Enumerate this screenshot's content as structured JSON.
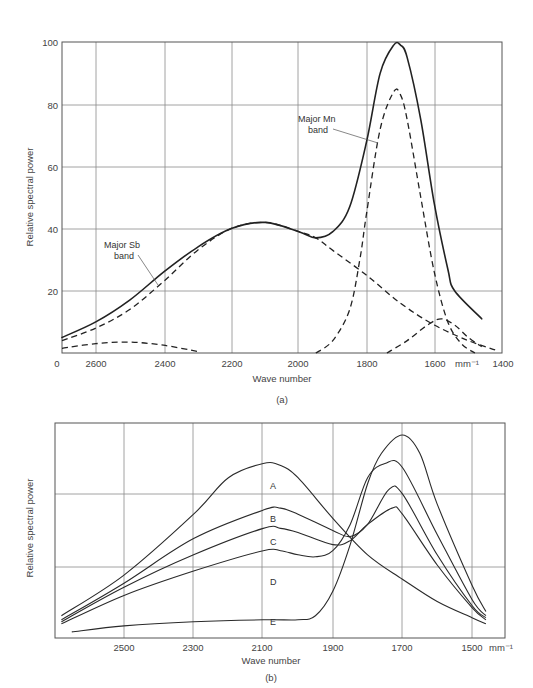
{
  "chart_data": [
    {
      "id": "a",
      "type": "line",
      "caption": "(a)",
      "title": "",
      "xlabel": "Wave number",
      "ylabel": "Relative spectral power",
      "x_unit": "mm⁻¹",
      "xlim": [
        2700,
        1400
      ],
      "ylim": [
        0,
        100
      ],
      "x_ticks": [
        "2600",
        "2400",
        "2200",
        "2000",
        "1800",
        "1600",
        "1400"
      ],
      "y_ticks": [
        "0",
        "20",
        "40",
        "60",
        "80",
        "100"
      ],
      "grid": true,
      "annotations": [
        {
          "text": "Major  Sb",
          "text2": "band"
        },
        {
          "text": "Major  Mn",
          "text2": "band"
        }
      ],
      "series": [
        {
          "name": "Total spectrum",
          "style": "solid",
          "x": [
            2700,
            2600,
            2500,
            2400,
            2300,
            2200,
            2100,
            2000,
            1950,
            1900,
            1850,
            1800,
            1760,
            1720,
            1700,
            1680,
            1640,
            1600,
            1560,
            1540,
            1460
          ],
          "y": [
            5,
            10,
            17,
            26,
            34,
            40,
            42,
            39,
            37,
            39,
            47,
            68,
            90,
            99,
            99,
            95,
            75,
            48,
            27,
            20,
            11
          ]
        },
        {
          "name": "Major Sb band",
          "style": "dashed",
          "x": [
            2700,
            2600,
            2500,
            2400,
            2300,
            2200,
            2100,
            2000,
            1950,
            1900,
            1800,
            1700,
            1600,
            1500,
            1420
          ],
          "y": [
            4,
            8,
            14,
            23,
            33,
            40,
            42,
            39,
            37,
            33,
            25,
            16,
            9,
            4,
            1
          ]
        },
        {
          "name": "Major Mn band",
          "style": "dashed",
          "x": [
            1950,
            1900,
            1850,
            1820,
            1800,
            1760,
            1720,
            1700,
            1680,
            1640,
            1600,
            1560,
            1520,
            1480
          ],
          "y": [
            0,
            4,
            14,
            30,
            45,
            72,
            84,
            83,
            75,
            50,
            26,
            10,
            3,
            0
          ]
        },
        {
          "name": "Minor band (low)",
          "style": "dashed",
          "x": [
            2700,
            2600,
            2500,
            2400,
            2300
          ],
          "y": [
            1.5,
            3,
            3.5,
            2.5,
            0.5
          ]
        },
        {
          "name": "Minor band (1580)",
          "style": "dashed",
          "x": [
            1740,
            1680,
            1620,
            1580,
            1540,
            1500,
            1460
          ],
          "y": [
            0,
            4,
            9,
            11,
            9,
            5,
            2
          ]
        }
      ]
    },
    {
      "id": "b",
      "type": "line",
      "caption": "(b)",
      "title": "",
      "xlabel": "Wave number",
      "ylabel": "Relative spectral power",
      "x_unit": "mm⁻¹",
      "xlim": [
        2700,
        1420
      ],
      "x_ticks": [
        "2500",
        "2300",
        "2100",
        "1900",
        "1700",
        "1500 mm⁻¹"
      ],
      "y_ticks": [],
      "grid": true,
      "series": [
        {
          "name": "A",
          "x": [
            2680,
            2500,
            2300,
            2200,
            2100,
            2050,
            2000,
            1900,
            1800,
            1700,
            1600,
            1500,
            1460
          ],
          "y": [
            10,
            30,
            60,
            78,
            85,
            84,
            78,
            58,
            40,
            28,
            17,
            9,
            6
          ]
        },
        {
          "name": "B",
          "x": [
            2680,
            2500,
            2300,
            2100,
            2050,
            2000,
            1900,
            1850,
            1800,
            1740,
            1700,
            1600,
            1500,
            1460
          ],
          "y": [
            8,
            26,
            48,
            62,
            63,
            60,
            52,
            49,
            55,
            72,
            70,
            40,
            15,
            9
          ]
        },
        {
          "name": "C",
          "x": [
            2680,
            2500,
            2300,
            2100,
            2050,
            2000,
            1900,
            1850,
            1800,
            1730,
            1700,
            1600,
            1500,
            1460
          ],
          "y": [
            7,
            24,
            40,
            53,
            53,
            51,
            45,
            47,
            55,
            63,
            60,
            35,
            14,
            8
          ]
        },
        {
          "name": "D",
          "x": [
            2680,
            2500,
            2300,
            2100,
            2050,
            2000,
            1950,
            1900,
            1850,
            1800,
            1750,
            1700,
            1600,
            1500,
            1460
          ],
          "y": [
            6,
            20,
            32,
            42,
            42,
            40,
            39,
            42,
            55,
            78,
            85,
            83,
            50,
            18,
            10
          ]
        },
        {
          "name": "E",
          "x": [
            2650,
            2500,
            2300,
            2100,
            2000,
            1950,
            1900,
            1850,
            1800,
            1760,
            1700,
            1650,
            1600,
            1500,
            1460
          ],
          "y": [
            2,
            5,
            7,
            8,
            8,
            10,
            22,
            45,
            75,
            90,
            99,
            90,
            65,
            25,
            12
          ]
        }
      ]
    }
  ],
  "figure": {
    "a": {
      "caption": "(a)",
      "xlabel": "Wave number",
      "ylabel": "Relative spectral power",
      "unit": "mm⁻¹",
      "x_ticks": [
        "2600",
        "2400",
        "2200",
        "2000",
        "1800",
        "1600",
        "1400"
      ],
      "x_origin_label": "0",
      "y_ticks": [
        "100",
        "80",
        "60",
        "40",
        "20"
      ],
      "sb_label_1": "Major  Sb",
      "sb_label_2": "band",
      "mn_label_1": "Major  Mn",
      "mn_label_2": "band"
    },
    "b": {
      "caption": "(b)",
      "xlabel": "Wave number",
      "ylabel": "Relative spectral power",
      "unit": "mm⁻¹",
      "x_ticks": [
        "2500",
        "2300",
        "2100",
        "1900",
        "1700",
        "1500"
      ],
      "curve_labels": [
        "A",
        "B",
        "C",
        "D",
        "E"
      ]
    }
  }
}
